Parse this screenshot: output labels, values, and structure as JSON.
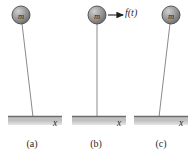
{
  "figure": {
    "mass_label": "m",
    "displacement_label": "x",
    "force_label": "f(t)",
    "colors": {
      "ball_fill_light": "#c9c9c9",
      "ball_fill_dark": "#6e6e6e",
      "ball_stroke": "#3d3d3d",
      "rod": "#808080",
      "base_top_edge": "#6b6b6b",
      "base_fill_light": "#d9d9d9",
      "base_fill_dark": "#a8a8a8",
      "text": "#2a2a2a",
      "arrow": "#1f1f1f",
      "background": "#ffffff"
    },
    "panels": [
      {
        "id": "a",
        "caption": "(a)",
        "mass_label": "m",
        "displacement_label": "x",
        "has_force_arrow": false,
        "force_label": "",
        "tilt_description": "leaning-left",
        "ball_cx": 21,
        "ball_cy": 15,
        "ball_r": 9,
        "pivot_x": 33,
        "pivot_y": 117,
        "base_x1": 8,
        "base_x2": 62,
        "base_y": 117,
        "x_label_x": 55,
        "x_label_y": 125
      },
      {
        "id": "b",
        "caption": "(b)",
        "mass_label": "m",
        "displacement_label": "x",
        "has_force_arrow": true,
        "force_label": "f(t)",
        "tilt_description": "vertical",
        "ball_cx": 33,
        "ball_cy": 15,
        "ball_r": 9,
        "pivot_x": 33,
        "pivot_y": 117,
        "base_x1": 8,
        "base_x2": 62,
        "base_y": 117,
        "x_label_x": 55,
        "x_label_y": 125,
        "arrow_x1": 44,
        "arrow_x2": 61,
        "arrow_y": 15
      },
      {
        "id": "c",
        "caption": "(c)",
        "mass_label": "m",
        "displacement_label": "x",
        "has_force_arrow": false,
        "force_label": "",
        "tilt_description": "leaning-right",
        "ball_cx": 42,
        "ball_cy": 15,
        "ball_r": 9,
        "pivot_x": 30,
        "pivot_y": 117,
        "base_x1": 5,
        "base_x2": 59,
        "base_y": 117,
        "x_label_x": 52,
        "x_label_y": 125
      }
    ]
  }
}
